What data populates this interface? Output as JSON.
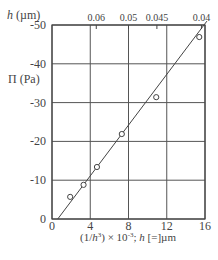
{
  "chart_data": {
    "type": "scatter",
    "title": "",
    "xlabel": "(1/h³) × 10⁻³; h [=]µm",
    "ylabel": "Π (Pa)",
    "top_axis_label": "h (µm)",
    "xlim": [
      0,
      16
    ],
    "ylim": [
      0,
      -50
    ],
    "grid": true,
    "legend": "none",
    "x_ticks": [
      "0",
      "4",
      "8",
      "12",
      "16"
    ],
    "y_ticks": [
      "0",
      "-10",
      "-20",
      "-30",
      "-40",
      "-50"
    ],
    "top_ticks": [
      {
        "label": "0.06",
        "x": 4.63
      },
      {
        "label": "0.05",
        "x": 8.0
      },
      {
        "label": "0.045",
        "x": 10.97
      },
      {
        "label": "0.04",
        "x": 15.63
      }
    ],
    "series": [
      {
        "name": "measured",
        "marker": "open-circle",
        "points": [
          {
            "x": 1.9,
            "y": -5.7
          },
          {
            "x": 3.3,
            "y": -8.8
          },
          {
            "x": 4.7,
            "y": -13.4
          },
          {
            "x": 7.3,
            "y": -21.9
          },
          {
            "x": 10.9,
            "y": -31.4
          },
          {
            "x": 15.4,
            "y": -46.9
          }
        ]
      },
      {
        "name": "linear fit",
        "type": "line",
        "points": [
          {
            "x": 0.6,
            "y": 0.0
          },
          {
            "x": 16.2,
            "y": -51.0
          }
        ]
      }
    ]
  },
  "labels": {
    "top_axis": "h (µm)",
    "y_axis": "Π (Pa)",
    "x_axis": "(1/h³) × 10⁻³; h [=]µm"
  }
}
